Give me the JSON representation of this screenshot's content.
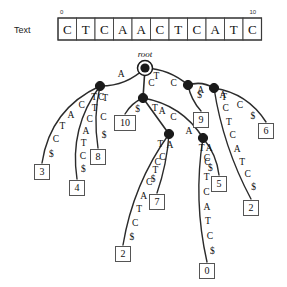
{
  "header": {
    "text_label": "Text",
    "sequence": [
      "C",
      "T",
      "C",
      "A",
      "A",
      "C",
      "T",
      "C",
      "A",
      "T",
      "C"
    ],
    "index_start": "0",
    "index_end": "10"
  },
  "tree": {
    "root_label": "root",
    "terminator": "$",
    "nodes": [
      {
        "id": "root",
        "x": 145,
        "y": 68,
        "kind": "root"
      },
      {
        "id": "nA",
        "x": 100,
        "y": 86,
        "kind": "internal"
      },
      {
        "id": "nC",
        "x": 143,
        "y": 98,
        "kind": "internal"
      },
      {
        "id": "nTC",
        "x": 188,
        "y": 85,
        "kind": "internal"
      },
      {
        "id": "nCA",
        "x": 169,
        "y": 134,
        "kind": "internal"
      },
      {
        "id": "nTCA",
        "x": 214,
        "y": 88,
        "kind": "internal"
      },
      {
        "id": "nCAA",
        "x": 203,
        "y": 138,
        "kind": "internal"
      }
    ],
    "edges": [
      {
        "id": "e-root-A",
        "from": "root",
        "to": "nA",
        "labels": [
          "A"
        ]
      },
      {
        "id": "e-root-C",
        "from": "root",
        "to": "nC",
        "labels": [
          "C"
        ]
      },
      {
        "id": "e-root-TC",
        "from": "root",
        "to": "nTC",
        "labels": [
          "T",
          "C"
        ]
      },
      {
        "id": "e-A-leaf3",
        "from": "nA",
        "to": "leaf3",
        "labels": [
          "T",
          "C",
          "A",
          "T",
          "C",
          "$"
        ]
      },
      {
        "id": "e-A-leaf4",
        "from": "nA",
        "to": "leaf4",
        "labels": [
          "C",
          "T",
          "C",
          "A",
          "T",
          "C",
          "$"
        ]
      },
      {
        "id": "e-A-leaf8",
        "from": "nA",
        "to": "leaf8",
        "labels": [
          "T",
          "C",
          "$"
        ]
      },
      {
        "id": "e-C-leaf10",
        "from": "nC",
        "to": "leaf10",
        "labels": [
          "$"
        ]
      },
      {
        "id": "e-C-A",
        "from": "nC",
        "to": "nCA",
        "labels": [
          "A"
        ]
      },
      {
        "id": "e-C-TCA",
        "from": "nC",
        "to": "nCAA",
        "labels": [
          "T",
          "C",
          "A"
        ]
      },
      {
        "id": "e-CA-leaf2",
        "from": "nCA",
        "to": "leaf2a",
        "labels": [
          "A",
          "C",
          "T",
          "C",
          "A",
          "T",
          "C",
          "$"
        ]
      },
      {
        "id": "e-CA-leaf7",
        "from": "nCA",
        "to": "leaf7",
        "labels": [
          "T",
          "C",
          "$"
        ]
      },
      {
        "id": "e-CAA-leaf0",
        "from": "nCAA",
        "to": "leaf0",
        "labels": [
          "A",
          "C",
          "T",
          "C",
          "A",
          "T",
          "C",
          "$"
        ]
      },
      {
        "id": "e-CAA-leaf5",
        "from": "nCAA",
        "to": "leaf5",
        "labels": [
          "T",
          "C",
          "$"
        ]
      },
      {
        "id": "e-TC-leaf9",
        "from": "nTC",
        "to": "leaf9",
        "labels": [
          "$"
        ]
      },
      {
        "id": "e-TC-A",
        "from": "nTC",
        "to": "nTCA",
        "labels": [
          "A"
        ]
      },
      {
        "id": "e-TCA-leaf6",
        "from": "nTCA",
        "to": "leaf6",
        "labels": [
          "T",
          "C",
          "$"
        ]
      },
      {
        "id": "e-TCA-leaf2b",
        "from": "nTCA",
        "to": "leaf2b",
        "labels": [
          "A",
          "C",
          "T",
          "C",
          "A",
          "T",
          "C",
          "$"
        ]
      }
    ],
    "leaves": [
      {
        "id": "leaf3",
        "label": "3",
        "x": 42,
        "y": 172
      },
      {
        "id": "leaf4",
        "label": "4",
        "x": 77,
        "y": 188
      },
      {
        "id": "leaf8",
        "label": "8",
        "x": 98,
        "y": 157
      },
      {
        "id": "leaf10",
        "label": "10",
        "x": 125,
        "y": 123
      },
      {
        "id": "leaf2a",
        "label": "2",
        "x": 123,
        "y": 254
      },
      {
        "id": "leaf7",
        "label": "7",
        "x": 157,
        "y": 202
      },
      {
        "id": "leaf0",
        "label": "0",
        "x": 207,
        "y": 271
      },
      {
        "id": "leaf5",
        "label": "5",
        "x": 219,
        "y": 184
      },
      {
        "id": "leaf9",
        "label": "9",
        "x": 201,
        "y": 120
      },
      {
        "id": "leaf6",
        "label": "6",
        "x": 266,
        "y": 131
      },
      {
        "id": "leaf2b",
        "label": "2",
        "x": 251,
        "y": 208
      }
    ]
  },
  "colors": {
    "stroke": "#2b2b2b",
    "node_fill": "#1a1a1a",
    "box_stroke": "#555555",
    "background": "#ffffff"
  }
}
